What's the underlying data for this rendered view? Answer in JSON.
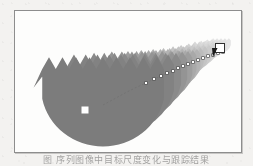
{
  "page": {
    "background_color": "#f3f2f0",
    "caption_text": "图 序列图像中目标尺度变化与跟踪结果"
  },
  "figure": {
    "frame": {
      "border_color": "#8d8d8d",
      "background_color": "#fdfdfc",
      "x": 14,
      "y": 10,
      "width": 226,
      "height": 141
    },
    "colors": {
      "shape_dark": "#7b7b7b",
      "shape_mid": "#9a9a9a",
      "shape_light": "#c9c9c9",
      "shape_faint": "#e2e2e2",
      "marker_fill": "#ffffff",
      "marker_stroke": "#303030",
      "arrow_fill": "#1c1c1c",
      "path_color": "#6b6b6b"
    }
  },
  "chart_data": {
    "type": "scatter",
    "title": "",
    "xlabel": "",
    "ylabel": "",
    "grid": false,
    "legend": "none",
    "xlim": [
      0,
      226
    ],
    "ylim": [
      0,
      141
    ],
    "shapes": [
      {
        "index": 1,
        "cx": 88,
        "cy": 94,
        "r": 62,
        "fill": "#7b7b7b",
        "teeth": 9,
        "label": "frame-01"
      },
      {
        "index": 2,
        "cx": 106,
        "cy": 85,
        "r": 54,
        "fill": "#828282",
        "teeth": 9,
        "label": "frame-02"
      },
      {
        "index": 3,
        "cx": 120,
        "cy": 78,
        "r": 47,
        "fill": "#8a8a8a",
        "teeth": 9,
        "label": "frame-03"
      },
      {
        "index": 4,
        "cx": 132,
        "cy": 72,
        "r": 41,
        "fill": "#949494",
        "teeth": 8,
        "label": "frame-04"
      },
      {
        "index": 5,
        "cx": 143,
        "cy": 67,
        "r": 35,
        "fill": "#9e9e9e",
        "teeth": 8,
        "label": "frame-05"
      },
      {
        "index": 6,
        "cx": 152,
        "cy": 62,
        "r": 30,
        "fill": "#a9a9a9",
        "teeth": 8,
        "label": "frame-06"
      },
      {
        "index": 7,
        "cx": 160,
        "cy": 58,
        "r": 26,
        "fill": "#b3b3b3",
        "teeth": 7,
        "label": "frame-07"
      },
      {
        "index": 8,
        "cx": 167,
        "cy": 54,
        "r": 22,
        "fill": "#bcbcbc",
        "teeth": 7,
        "label": "frame-08"
      },
      {
        "index": 9,
        "cx": 174,
        "cy": 50,
        "r": 19,
        "fill": "#c4c4c4",
        "teeth": 7,
        "label": "frame-09"
      },
      {
        "index": 10,
        "cx": 180,
        "cy": 47,
        "r": 17,
        "fill": "#cbcbcb",
        "teeth": 6,
        "label": "frame-10"
      },
      {
        "index": 11,
        "cx": 186,
        "cy": 44,
        "r": 15,
        "fill": "#d2d2d2",
        "teeth": 6,
        "label": "frame-11"
      },
      {
        "index": 12,
        "cx": 191,
        "cy": 41,
        "r": 13.5,
        "fill": "#d8d8d8",
        "teeth": 6,
        "label": "frame-12"
      },
      {
        "index": 13,
        "cx": 196,
        "cy": 39,
        "r": 12,
        "fill": "#dddddd",
        "teeth": 6,
        "label": "frame-13"
      },
      {
        "index": 14,
        "cx": 201,
        "cy": 37,
        "r": 11,
        "fill": "#e1e1e1",
        "teeth": 5,
        "label": "frame-14"
      },
      {
        "index": 15,
        "cx": 206,
        "cy": 35,
        "r": 10,
        "fill": "#e5e5e5",
        "teeth": 5,
        "label": "frame-15"
      }
    ],
    "track_path": {
      "name": "centroid-track",
      "x": [
        88,
        101,
        112,
        122,
        131,
        139,
        146,
        152,
        158,
        163,
        168,
        173,
        178,
        183,
        188,
        193,
        198,
        203,
        208
      ],
      "y": [
        94,
        87,
        81,
        76,
        72,
        68,
        65,
        62,
        60,
        57,
        55,
        53,
        51,
        49,
        47,
        45,
        44,
        42,
        41
      ]
    },
    "markers": [
      {
        "name": "start-marker",
        "x": 70,
        "y": 99,
        "size": 7,
        "style": "filled-white-square"
      },
      {
        "name": "end-marker",
        "x": 205,
        "y": 37,
        "size": 9,
        "style": "outlined-white-square"
      },
      {
        "name": "direction-arrow",
        "x": 197,
        "y": 42,
        "size": 9,
        "style": "filled-dark-triangle",
        "points_to": "down-left"
      }
    ]
  }
}
